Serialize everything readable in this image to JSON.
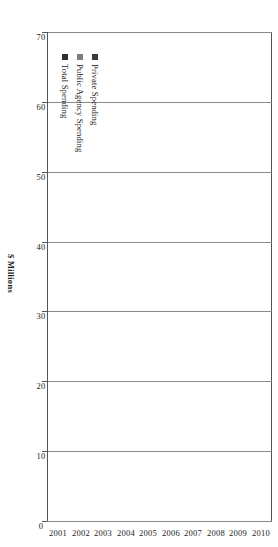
{
  "chart_data": {
    "type": "bar",
    "orientation": "horizontal-bar-rotated-page",
    "title": "",
    "subtitle": "",
    "xlabel": "",
    "ylabel": "$ Millions",
    "value_axis_title": "$ Millions",
    "categories": [
      "2001",
      "2002",
      "2003",
      "2004",
      "2005",
      "2006",
      "2007",
      "2008",
      "2009",
      "2010"
    ],
    "ticks": [
      0,
      10,
      20,
      30,
      40,
      50,
      60,
      70
    ],
    "tick_labels": [
      "0",
      "10",
      "20",
      "30",
      "40",
      "50",
      "60",
      "70"
    ],
    "ylim": [
      0,
      70
    ],
    "xlim": [
      0,
      70
    ],
    "grid": true,
    "grid_axis": "value",
    "legend_position": "inside-left",
    "series": [
      {
        "name": "Private Spending",
        "color": "#3b3b3b",
        "values": [
          30.0,
          32.5,
          36.0,
          37.5,
          39.0,
          44.5,
          48.0,
          55.5,
          48.5,
          55.0
        ]
      },
      {
        "name": "Public Agency Spending",
        "color": "#7d7d7d",
        "values": [
          2.5,
          3.0,
          3.5,
          3.5,
          3.5,
          3.5,
          4.5,
          4.0,
          4.0,
          4.5
        ]
      },
      {
        "name": "Total Spending",
        "color": "#2f2f2f",
        "values": [
          33.0,
          35.5,
          39.5,
          40.0,
          42.5,
          49.0,
          52.5,
          58.5,
          52.5,
          60.5
        ]
      }
    ]
  },
  "legend": {
    "items": [
      {
        "label": "Private Spending",
        "color": "#3b3b3b"
      },
      {
        "label": "Public Agency Spending",
        "color": "#7d7d7d"
      },
      {
        "label": "Total Spending",
        "color": "#2f2f2f"
      }
    ]
  },
  "axis": {
    "value_title": "$ Millions"
  }
}
